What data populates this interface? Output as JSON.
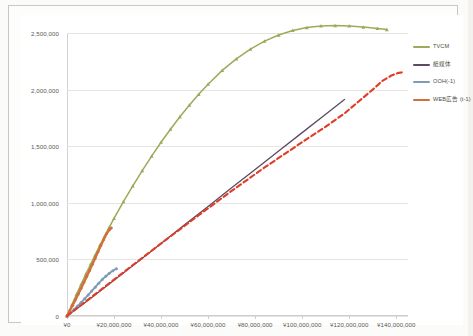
{
  "chart_data": {
    "type": "line",
    "title": "",
    "subtitle": "",
    "xlabel": "",
    "ylabel": "",
    "xlim": [
      0,
      145000000
    ],
    "ylim": [
      0,
      2500000
    ],
    "grid": true,
    "legend_position": "right",
    "xticks": [
      0,
      20000000,
      40000000,
      60000000,
      80000000,
      100000000,
      120000000,
      140000000
    ],
    "xtick_labels": [
      "¥0",
      "¥20,000,000",
      "¥40,000,000",
      "¥60,000,000",
      "¥80,000,000",
      "¥100,000,000",
      "¥120,000,000",
      "¥140,000,000"
    ],
    "yticks": [
      0,
      500000,
      1000000,
      1500000,
      2000000,
      2500000
    ],
    "ytick_labels": [
      "0",
      "500,000",
      "1,000,000",
      "1,500,000",
      "2,000,000",
      "2,500,000"
    ],
    "series": [
      {
        "name": "TVCM",
        "color": "#9aab5a",
        "style": "solid-markers",
        "marker": "triangle",
        "points": [
          [
            0,
            0
          ],
          [
            2000000,
            95000
          ],
          [
            4000000,
            190000
          ],
          [
            6000000,
            280000
          ],
          [
            8000000,
            370000
          ],
          [
            10000000,
            455000
          ],
          [
            12000000,
            540000
          ],
          [
            14000000,
            625000
          ],
          [
            16000000,
            705000
          ],
          [
            18000000,
            785000
          ],
          [
            20000000,
            862000
          ],
          [
            24000000,
            1010000
          ],
          [
            28000000,
            1150000
          ],
          [
            32000000,
            1285000
          ],
          [
            36000000,
            1412000
          ],
          [
            40000000,
            1535000
          ],
          [
            44000000,
            1650000
          ],
          [
            48000000,
            1760000
          ],
          [
            52000000,
            1862000
          ],
          [
            56000000,
            1958000
          ],
          [
            60000000,
            2048000
          ],
          [
            66000000,
            2170000
          ],
          [
            72000000,
            2272000
          ],
          [
            78000000,
            2358000
          ],
          [
            84000000,
            2428000
          ],
          [
            90000000,
            2482000
          ],
          [
            96000000,
            2522000
          ],
          [
            102000000,
            2548000
          ],
          [
            108000000,
            2562000
          ],
          [
            114000000,
            2566000
          ],
          [
            120000000,
            2562000
          ],
          [
            126000000,
            2552000
          ],
          [
            132000000,
            2540000
          ],
          [
            136000000,
            2530000
          ]
        ]
      },
      {
        "name": "紙媒体",
        "color": "#5d4a63",
        "style": "solid",
        "marker": "none",
        "points": [
          [
            0,
            0
          ],
          [
            10000000,
            155000
          ],
          [
            20000000,
            315000
          ],
          [
            30000000,
            478000
          ],
          [
            40000000,
            640000
          ],
          [
            50000000,
            805000
          ],
          [
            60000000,
            968000
          ],
          [
            70000000,
            1132000
          ],
          [
            80000000,
            1295000
          ],
          [
            90000000,
            1458000
          ],
          [
            100000000,
            1620000
          ],
          [
            110000000,
            1782000
          ],
          [
            118000000,
            1912000
          ]
        ]
      },
      {
        "name": "OOH(-1)",
        "color": "#7e9cb5",
        "style": "solid-markers",
        "marker": "dot",
        "points": [
          [
            0,
            0
          ],
          [
            1500000,
            28000
          ],
          [
            3000000,
            58000
          ],
          [
            4500000,
            88000
          ],
          [
            6000000,
            120000
          ],
          [
            7500000,
            152000
          ],
          [
            9000000,
            186000
          ],
          [
            10500000,
            220000
          ],
          [
            12000000,
            255000
          ],
          [
            13500000,
            290000
          ],
          [
            15000000,
            322000
          ],
          [
            16500000,
            352000
          ],
          [
            18000000,
            378000
          ],
          [
            19500000,
            400000
          ],
          [
            21000000,
            418000
          ]
        ]
      },
      {
        "name": "WEB広告 (t-1)",
        "color": "#d1703a",
        "style": "solid-markers",
        "marker": "dot",
        "points": [
          [
            0,
            0
          ],
          [
            1200000,
            48000
          ],
          [
            2400000,
            96000
          ],
          [
            3600000,
            145000
          ],
          [
            4800000,
            195000
          ],
          [
            6000000,
            246000
          ],
          [
            7200000,
            298000
          ],
          [
            8400000,
            350000
          ],
          [
            9600000,
            403000
          ],
          [
            10800000,
            457000
          ],
          [
            12000000,
            512000
          ],
          [
            13200000,
            568000
          ],
          [
            14400000,
            622000
          ],
          [
            15600000,
            676000
          ],
          [
            16800000,
            726000
          ],
          [
            18000000,
            762000
          ],
          [
            18800000,
            778000
          ]
        ]
      },
      {
        "name": "trendline",
        "color": "#e03c28",
        "style": "dashed",
        "marker": "none",
        "points": [
          [
            0,
            0
          ],
          [
            14000000,
            225000
          ],
          [
            28000000,
            450000
          ],
          [
            42000000,
            672000
          ],
          [
            56000000,
            890000
          ],
          [
            70000000,
            1105000
          ],
          [
            84000000,
            1312000
          ],
          [
            98000000,
            1508000
          ],
          [
            110000000,
            1672000
          ],
          [
            118000000,
            1790000
          ],
          [
            124000000,
            1895000
          ],
          [
            130000000,
            2000000
          ],
          [
            134000000,
            2075000
          ],
          [
            138000000,
            2125000
          ],
          [
            141000000,
            2148000
          ],
          [
            143500000,
            2155000
          ]
        ]
      }
    ],
    "legend": [
      {
        "label": "TVCM",
        "color": "#9aab5a"
      },
      {
        "label": "紙媒体",
        "color": "#5d4a63"
      },
      {
        "label": "OOH(-1)",
        "color": "#7e9cb5"
      },
      {
        "label": "WEB広告 (t-1)",
        "color": "#d1703a"
      }
    ]
  }
}
